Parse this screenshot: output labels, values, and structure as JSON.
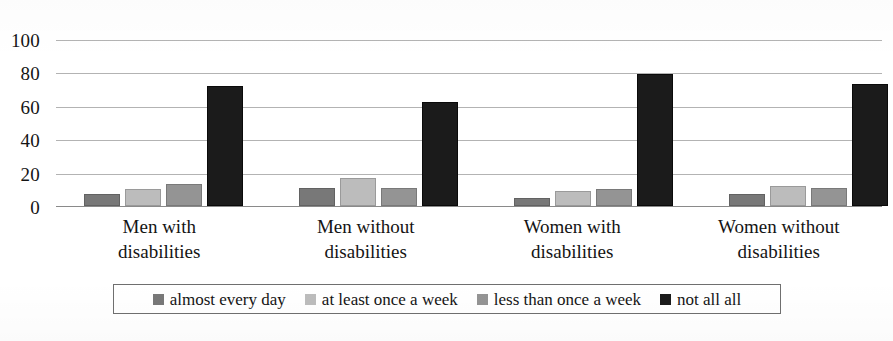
{
  "chart_data": {
    "type": "bar",
    "title": "",
    "xlabel": "",
    "ylabel": "",
    "ylim": [
      0,
      100
    ],
    "yticks": [
      0,
      20,
      40,
      60,
      80,
      100
    ],
    "grid": true,
    "legend_position": "bottom",
    "categories": [
      {
        "line1": "Men with",
        "line2": "disabilities"
      },
      {
        "line1": "Men without",
        "line2": "disabilities"
      },
      {
        "line1": "Women with",
        "line2": "disabilities"
      },
      {
        "line1": "Women without",
        "line2": "disabilities"
      }
    ],
    "category_labels": [
      "Men with disabilities",
      "Men without disabilities",
      "Women with disabilities",
      "Women without disabilities"
    ],
    "series": [
      {
        "name": "almost every day",
        "color": "#787878",
        "values": [
          7,
          11,
          5,
          7
        ]
      },
      {
        "name": "at least once a week",
        "color": "#bcbcbc",
        "values": [
          10,
          17,
          9,
          12
        ]
      },
      {
        "name": "less than once a week",
        "color": "#949494",
        "values": [
          13,
          11,
          10,
          11
        ]
      },
      {
        "name": "not all all",
        "color": "#1b1b1b",
        "values": [
          72,
          62,
          79,
          73
        ]
      }
    ]
  }
}
